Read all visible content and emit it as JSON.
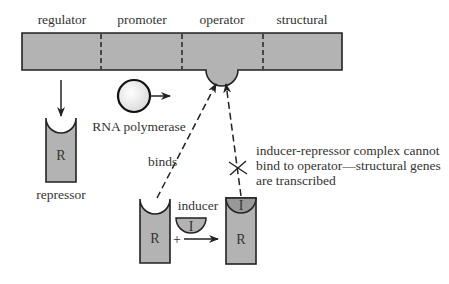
{
  "diagram": {
    "gene_regions": [
      {
        "label": "regulator"
      },
      {
        "label": "promoter"
      },
      {
        "label": "operator"
      },
      {
        "label": "structural"
      }
    ],
    "repressor": {
      "symbol": "R",
      "label": "repressor"
    },
    "rna_polymerase": {
      "label": "RNA polymerase"
    },
    "binds_label": "binds",
    "inducer": {
      "symbol": "I",
      "label": "inducer"
    },
    "plus_sign": "+",
    "complex": {
      "inducer_symbol": "I",
      "repressor_symbol": "R"
    },
    "left_repressor_symbol": "R",
    "note_lines": [
      "inducer-repressor complex cannot",
      "bind to operator—structural genes",
      "are transcribed"
    ],
    "colors": {
      "fill": "#b3b3b3",
      "stroke": "#222222",
      "text": "#333333"
    }
  }
}
